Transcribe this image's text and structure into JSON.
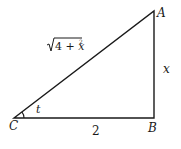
{
  "diagram": {
    "type": "right-triangle",
    "vertices": {
      "A": {
        "label": "A",
        "x": 154,
        "y": 11
      },
      "B": {
        "label": "B",
        "x": 154,
        "y": 118
      },
      "C": {
        "label": "C",
        "x": 14,
        "y": 118
      }
    },
    "sides": {
      "hypotenuse": {
        "label_base": "4 + x",
        "label_exp": "2",
        "label_full": "√(4 + x²)"
      },
      "opposite": {
        "label": "x"
      },
      "adjacent": {
        "label": "2"
      }
    },
    "angle": {
      "label": "t",
      "at": "C"
    },
    "colors": {
      "stroke": "#1a1a1a",
      "background": "#ffffff"
    }
  }
}
